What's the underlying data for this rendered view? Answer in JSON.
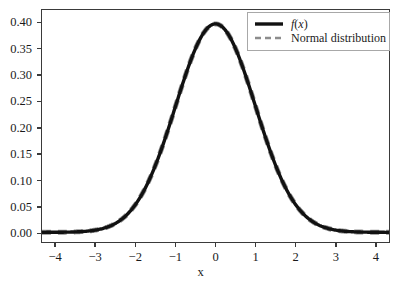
{
  "figure": {
    "background_color": "#ffffff",
    "axes_edge_color": "#3a3a3a",
    "text_color": "#1a1a1a"
  },
  "axis": {
    "xlabel": "x",
    "ylabel": "",
    "x_tick_labels": [
      "−4",
      "−3",
      "−2",
      "−1",
      "0",
      "1",
      "2",
      "3",
      "4"
    ],
    "y_tick_labels": [
      "0.00",
      "0.05",
      "0.10",
      "0.15",
      "0.20",
      "0.25",
      "0.30",
      "0.35",
      "0.40"
    ]
  },
  "legend": {
    "position": "upper right",
    "entries": [
      {
        "label": "f(x)",
        "style": "solid",
        "color": "#111111",
        "width": 3.2
      },
      {
        "label": "Normal distribution",
        "style": "dashed",
        "color": "#8c8c8c",
        "width": 2.0
      }
    ]
  },
  "chart_data": {
    "type": "line",
    "title": "",
    "xlabel": "x",
    "ylabel": "",
    "xlim": [
      -4.35,
      4.35
    ],
    "ylim": [
      -0.0185,
      0.4255
    ],
    "xticks": [
      -4,
      -3,
      -2,
      -1,
      0,
      1,
      2,
      3,
      4
    ],
    "yticks": [
      0.0,
      0.05,
      0.1,
      0.15,
      0.2,
      0.25,
      0.3,
      0.35,
      0.4
    ],
    "grid": false,
    "legend_position": "upper right",
    "x": [
      -4.0,
      -3.8,
      -3.6,
      -3.4,
      -3.2,
      -3.0,
      -2.8,
      -2.6,
      -2.4,
      -2.2,
      -2.0,
      -1.8,
      -1.6,
      -1.4,
      -1.2,
      -1.0,
      -0.8,
      -0.6,
      -0.4,
      -0.2,
      0.0,
      0.2,
      0.4,
      0.6,
      0.8,
      1.0,
      1.2,
      1.4,
      1.6,
      1.8,
      2.0,
      2.2,
      2.4,
      2.6,
      2.8,
      3.0,
      3.2,
      3.4,
      3.6,
      3.8,
      4.0
    ],
    "series": [
      {
        "name": "f(x)",
        "style": "solid",
        "color": "#111111",
        "values": [
          0.0001,
          0.0003,
          0.0006,
          0.0012,
          0.0024,
          0.0044,
          0.0079,
          0.0136,
          0.0224,
          0.0355,
          0.054,
          0.079,
          0.1109,
          0.1497,
          0.1942,
          0.242,
          0.2897,
          0.3332,
          0.3683,
          0.391,
          0.3989,
          0.391,
          0.3683,
          0.3332,
          0.2897,
          0.242,
          0.1942,
          0.1497,
          0.1109,
          0.079,
          0.054,
          0.0355,
          0.0224,
          0.0136,
          0.0079,
          0.0044,
          0.0024,
          0.0012,
          0.0006,
          0.0003,
          0.0001
        ]
      },
      {
        "name": "Normal distribution",
        "style": "dashed",
        "color": "#8c8c8c",
        "values": [
          0.0001,
          0.0003,
          0.0006,
          0.0012,
          0.0024,
          0.0044,
          0.0079,
          0.0136,
          0.0224,
          0.0355,
          0.054,
          0.079,
          0.1109,
          0.1497,
          0.1942,
          0.242,
          0.2897,
          0.3332,
          0.3683,
          0.391,
          0.3989,
          0.391,
          0.3683,
          0.3332,
          0.2897,
          0.242,
          0.1942,
          0.1497,
          0.1109,
          0.079,
          0.054,
          0.0355,
          0.0224,
          0.0136,
          0.0079,
          0.0044,
          0.0024,
          0.0012,
          0.0006,
          0.0003,
          0.0001
        ]
      }
    ],
    "annotations": [],
    "peak": {
      "x": 0.0,
      "y": 0.3989
    },
    "distribution": {
      "mean": 0.0,
      "sigma": 1.0
    }
  }
}
